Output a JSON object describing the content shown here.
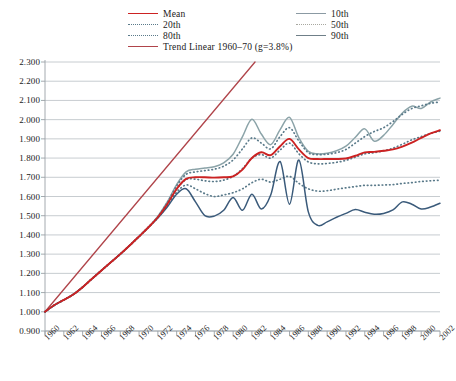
{
  "chart_data": {
    "type": "line",
    "title": "",
    "subtitle": "",
    "xlabel": "",
    "ylabel": "",
    "xlim": [
      1960,
      2002
    ],
    "ylim": [
      0.9,
      2.3
    ],
    "yticks": [
      "0.900",
      "1.000",
      "1.100",
      "1.200",
      "1.300",
      "1.400",
      "1.500",
      "1.600",
      "1.700",
      "1.800",
      "1.900",
      "2.000",
      "2.100",
      "2.200",
      "2.300"
    ],
    "ytick_values": [
      0.9,
      1.0,
      1.1,
      1.2,
      1.3,
      1.4,
      1.5,
      1.6,
      1.7,
      1.8,
      1.9,
      2.0,
      2.1,
      2.2,
      2.3
    ],
    "xticks": [
      "1960",
      "1962",
      "1964",
      "1966",
      "1968",
      "1970",
      "1972",
      "1974",
      "1976",
      "1978",
      "1980",
      "1982",
      "1984",
      "1986",
      "1988",
      "1990",
      "1992",
      "1994",
      "1996",
      "1998",
      "2000",
      "2002"
    ],
    "xtick_values": [
      1960,
      1962,
      1964,
      1966,
      1968,
      1970,
      1972,
      1974,
      1976,
      1978,
      1980,
      1982,
      1984,
      1986,
      1988,
      1990,
      1992,
      1994,
      1996,
      1998,
      2000,
      2002
    ],
    "x": [
      1960,
      1961,
      1962,
      1963,
      1964,
      1965,
      1966,
      1967,
      1968,
      1969,
      1970,
      1971,
      1972,
      1973,
      1974,
      1975,
      1976,
      1977,
      1978,
      1979,
      1980,
      1981,
      1982,
      1983,
      1984,
      1985,
      1986,
      1987,
      1988,
      1989,
      1990,
      1991,
      1992,
      1993,
      1994,
      1995,
      1996,
      1997,
      1998,
      1999,
      2000,
      2001,
      2002
    ],
    "grid": true,
    "legend_position": "top",
    "series": [
      {
        "name": "Mean",
        "color": "#cc2222",
        "style": "solid",
        "width": 1.9,
        "values": [
          1.0,
          1.035,
          1.062,
          1.09,
          1.128,
          1.172,
          1.215,
          1.258,
          1.3,
          1.345,
          1.392,
          1.44,
          1.492,
          1.56,
          1.64,
          1.692,
          1.7,
          1.7,
          1.698,
          1.7,
          1.705,
          1.74,
          1.8,
          1.83,
          1.815,
          1.862,
          1.9,
          1.845,
          1.8,
          1.795,
          1.795,
          1.795,
          1.798,
          1.812,
          1.83,
          1.832,
          1.838,
          1.845,
          1.86,
          1.88,
          1.905,
          1.928,
          1.945
        ]
      },
      {
        "name": "20th",
        "color": "#5a7a8a",
        "style": "dotted",
        "width": 1.6,
        "values": [
          1.0,
          1.035,
          1.062,
          1.09,
          1.128,
          1.172,
          1.215,
          1.258,
          1.3,
          1.345,
          1.392,
          1.44,
          1.49,
          1.55,
          1.622,
          1.66,
          1.64,
          1.615,
          1.6,
          1.608,
          1.62,
          1.64,
          1.672,
          1.69,
          1.675,
          1.69,
          1.705,
          1.668,
          1.64,
          1.628,
          1.63,
          1.638,
          1.645,
          1.652,
          1.658,
          1.658,
          1.66,
          1.662,
          1.668,
          1.672,
          1.678,
          1.682,
          1.685
        ]
      },
      {
        "name": "80th",
        "color": "#5a7a8a",
        "style": "dotted",
        "width": 1.6,
        "values": [
          1.0,
          1.035,
          1.062,
          1.09,
          1.128,
          1.172,
          1.215,
          1.258,
          1.3,
          1.345,
          1.392,
          1.44,
          1.495,
          1.568,
          1.655,
          1.715,
          1.728,
          1.735,
          1.742,
          1.758,
          1.79,
          1.848,
          1.905,
          1.878,
          1.848,
          1.912,
          1.958,
          1.888,
          1.828,
          1.818,
          1.82,
          1.828,
          1.845,
          1.878,
          1.912,
          1.938,
          1.958,
          1.99,
          2.028,
          2.058,
          2.072,
          2.085,
          2.092
        ]
      },
      {
        "name": "10th",
        "color": "#3a5a7a",
        "style": "solid",
        "width": 1.5,
        "values": [
          1.0,
          1.035,
          1.062,
          1.09,
          1.128,
          1.172,
          1.215,
          1.258,
          1.3,
          1.345,
          1.392,
          1.44,
          1.488,
          1.545,
          1.612,
          1.64,
          1.572,
          1.5,
          1.498,
          1.528,
          1.595,
          1.528,
          1.612,
          1.535,
          1.608,
          1.782,
          1.56,
          1.79,
          1.52,
          1.45,
          1.468,
          1.492,
          1.512,
          1.532,
          1.518,
          1.508,
          1.512,
          1.53,
          1.572,
          1.56,
          1.535,
          1.545,
          1.565
        ]
      },
      {
        "name": "50th",
        "color": "#5a7a8a",
        "style": "dotted",
        "width": 1.6,
        "values": [
          1.0,
          1.035,
          1.062,
          1.09,
          1.128,
          1.172,
          1.215,
          1.258,
          1.3,
          1.345,
          1.392,
          1.44,
          1.492,
          1.558,
          1.638,
          1.688,
          1.69,
          1.682,
          1.678,
          1.685,
          1.705,
          1.745,
          1.8,
          1.818,
          1.8,
          1.842,
          1.878,
          1.822,
          1.78,
          1.77,
          1.772,
          1.778,
          1.788,
          1.805,
          1.822,
          1.828,
          1.838,
          1.852,
          1.872,
          1.895,
          1.912,
          1.928,
          1.94
        ]
      },
      {
        "name": "90th",
        "color": "#8ba3a8",
        "style": "solid",
        "width": 1.5,
        "values": [
          1.0,
          1.035,
          1.062,
          1.09,
          1.128,
          1.172,
          1.215,
          1.258,
          1.3,
          1.345,
          1.392,
          1.44,
          1.498,
          1.572,
          1.662,
          1.728,
          1.742,
          1.748,
          1.755,
          1.775,
          1.82,
          1.912,
          2.002,
          1.925,
          1.87,
          1.948,
          2.012,
          1.905,
          1.835,
          1.822,
          1.825,
          1.838,
          1.862,
          1.908,
          1.952,
          1.888,
          1.918,
          1.975,
          2.035,
          2.07,
          2.058,
          2.092,
          2.112
        ]
      },
      {
        "name": "Trend Linear 1960–70 (g=3.8%)",
        "color": "#b0444a",
        "style": "solid",
        "width": 1.3,
        "trend": true,
        "start_year": 1960,
        "start_value": 1.0,
        "growth_pct": 3.8
      }
    ]
  },
  "legend": {
    "items": [
      {
        "label": "Mean",
        "color": "#cc2222",
        "style": "solid",
        "col": 0,
        "row": 0
      },
      {
        "label": "20th",
        "color": "#5a7a8a",
        "style": "dotted",
        "col": 0,
        "row": 1
      },
      {
        "label": "80th",
        "color": "#5a7a8a",
        "style": "dotted",
        "col": 0,
        "row": 2
      },
      {
        "label": "Trend Linear 1960–70 (g=3.8%)",
        "color": "#b0444a",
        "style": "solid",
        "col": 0,
        "row": 3
      },
      {
        "label": "10th",
        "color": "#8b9aa3",
        "style": "solid",
        "col": 1,
        "row": 0
      },
      {
        "label": "50th",
        "color": "#a8a8a0",
        "style": "dotted",
        "col": 1,
        "row": 1
      },
      {
        "label": "90th",
        "color": "#6f7f88",
        "style": "solid",
        "col": 1,
        "row": 2
      }
    ]
  }
}
